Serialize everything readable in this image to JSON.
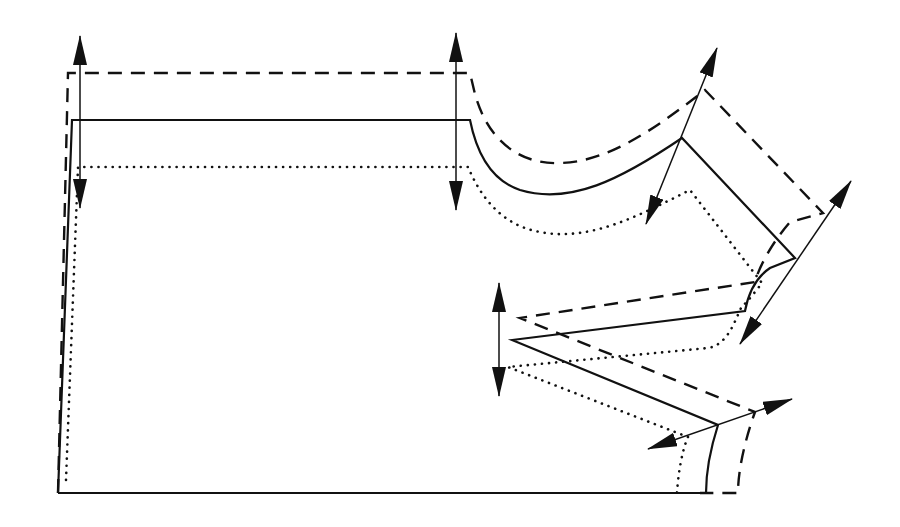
{
  "diagram": {
    "type": "pattern-grading-nest",
    "line_styles": [
      {
        "name": "base-size",
        "style": "solid",
        "color": "#111111"
      },
      {
        "name": "larger-size",
        "style": "dashed",
        "color": "#111111"
      },
      {
        "name": "smaller-size",
        "style": "dotted",
        "color": "#111111"
      }
    ],
    "grading_arrows": [
      {
        "name": "arrow-center-top",
        "x1": 80,
        "y1": 40,
        "x2": 80,
        "y2": 205
      },
      {
        "name": "arrow-neck-top",
        "x1": 456,
        "y1": 35,
        "x2": 456,
        "y2": 208
      },
      {
        "name": "arrow-shoulder-neck",
        "x1": 716,
        "y1": 50,
        "x2": 648,
        "y2": 222
      },
      {
        "name": "arrow-shoulder-tip",
        "x1": 850,
        "y1": 183,
        "x2": 742,
        "y2": 342
      },
      {
        "name": "arrow-dart-point",
        "x1": 499,
        "y1": 285,
        "x2": 499,
        "y2": 393
      },
      {
        "name": "arrow-side-waist",
        "x1": 790,
        "y1": 400,
        "x2": 650,
        "y2": 448
      }
    ]
  }
}
